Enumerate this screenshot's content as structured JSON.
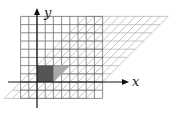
{
  "diagram": {
    "type": "shear-transformation",
    "axes": {
      "x_label": "x",
      "y_label": "y"
    },
    "grid": {
      "cells": 10,
      "origin_px": [
        37,
        82
      ],
      "cell_px": 8.2,
      "x_range_cells": [
        -2,
        8
      ],
      "y_range_cells": [
        -2,
        8
      ]
    },
    "shear": {
      "k": 1.0
    },
    "unit_square": {
      "size_cells": 2
    },
    "colors": {
      "grid": "#6e6e6e",
      "sheared_grid": "#b8b8b8",
      "axes": "#111111",
      "square": "#555555",
      "sheared_square": "#a9a9a9"
    }
  }
}
